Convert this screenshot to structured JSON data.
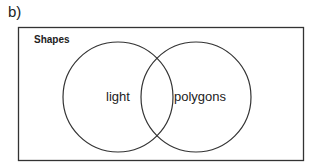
{
  "figure": {
    "panel_label": "b)",
    "universe": {
      "label": "Shapes"
    },
    "sets": [
      {
        "label": "light"
      },
      {
        "label": "polygons"
      }
    ],
    "colors": {
      "stroke": "#333333",
      "text": "#222222",
      "background": "#ffffff"
    }
  }
}
